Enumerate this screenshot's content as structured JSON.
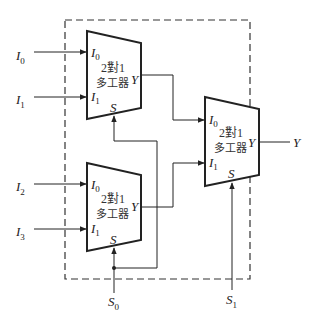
{
  "diagram": {
    "type": "4-to-1 multiplexer built from 2-to-1 multiplexers",
    "inputs": [
      {
        "name": "I",
        "sub": "0"
      },
      {
        "name": "I",
        "sub": "1"
      },
      {
        "name": "I",
        "sub": "2"
      },
      {
        "name": "I",
        "sub": "3"
      }
    ],
    "selects": [
      {
        "name": "S",
        "sub": "0"
      },
      {
        "name": "S",
        "sub": "1"
      }
    ],
    "output": {
      "name": "Y"
    },
    "mux_blocks": [
      {
        "id": "mux-top",
        "title_line1": "2對1",
        "title_line2": "多工器",
        "in0": "I",
        "in0_sub": "0",
        "in1": "I",
        "in1_sub": "1",
        "sel": "S",
        "out": "Y"
      },
      {
        "id": "mux-bottom",
        "title_line1": "2對1",
        "title_line2": "多工器",
        "in0": "I",
        "in0_sub": "0",
        "in1": "I",
        "in1_sub": "1",
        "sel": "S",
        "out": "Y"
      },
      {
        "id": "mux-final",
        "title_line1": "2對1",
        "title_line2": "多工器",
        "in0": "I",
        "in0_sub": "0",
        "in1": "I",
        "in1_sub": "1",
        "sel": "S",
        "out": "Y"
      }
    ]
  }
}
